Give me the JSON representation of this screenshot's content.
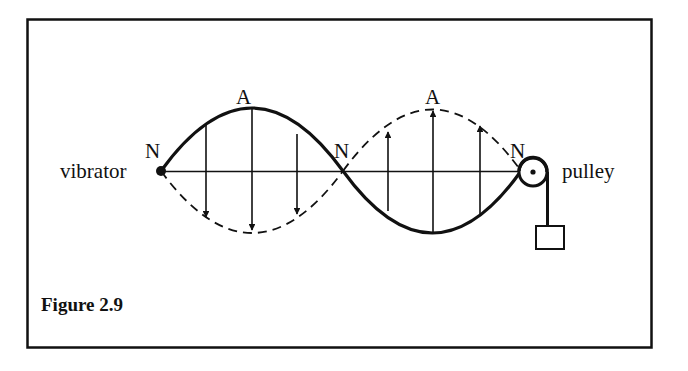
{
  "figure": {
    "caption": "Figure 2.9"
  },
  "labels": {
    "vibrator": "vibrator",
    "pulley": "pulley",
    "node_left": "N",
    "node_middle": "N",
    "node_right": "N",
    "antinode_left": "A",
    "antinode_right": "A"
  },
  "elements": {
    "nodes": [
      "N",
      "N",
      "N"
    ],
    "antinodes": [
      "A",
      "A"
    ],
    "loops": 2,
    "left_loop": {
      "solid": "up",
      "dashed": "down",
      "arrows": "down",
      "arrow_count": 3
    },
    "right_loop": {
      "solid": "down",
      "dashed": "up",
      "arrows": "up",
      "arrow_count": 3
    }
  },
  "colors": {
    "ink": "#111111",
    "background": "#ffffff"
  }
}
